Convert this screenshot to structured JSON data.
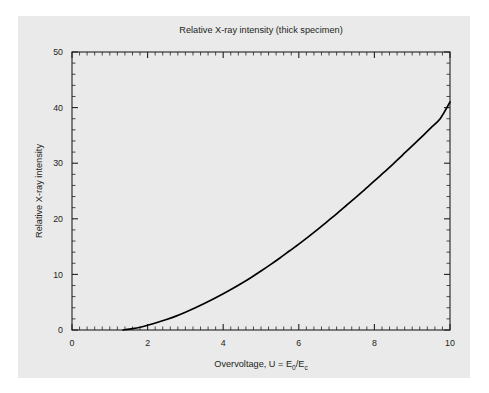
{
  "figure": {
    "background_color": "#ffffff",
    "panel_color": "#eaeaea",
    "curve_color": "#000000",
    "axis_color": "#231f20"
  },
  "chart_data": {
    "type": "line",
    "title": "Relative X-ray intensity (thick specimen)",
    "xlabel_main": "Overvoltage, U = E",
    "xlabel_sub1": "0",
    "xlabel_mid": "/E",
    "xlabel_sub2": "c",
    "xlabel": "Overvoltage, U = E0/Ec",
    "ylabel": "Relative X-ray intensity",
    "xlim": [
      0,
      10
    ],
    "ylim": [
      0,
      50
    ],
    "xticks": [
      0,
      2,
      4,
      6,
      8,
      10
    ],
    "xtick_labels": [
      "0",
      "2",
      "4",
      "6",
      "8",
      "10"
    ],
    "yticks": [
      0,
      10,
      20,
      30,
      40,
      50
    ],
    "ytick_labels": [
      "0",
      "10",
      "20",
      "30",
      "40",
      "50"
    ],
    "x_minor_step": 0.2,
    "y_minor_step": 2,
    "grid": false,
    "legend": null,
    "series": [
      {
        "name": "Relative X-ray intensity",
        "x": [
          1.35,
          1.6,
          1.8,
          2.0,
          2.25,
          2.5,
          2.75,
          3.0,
          3.25,
          3.5,
          3.75,
          4.0,
          4.25,
          4.5,
          4.75,
          5.0,
          5.25,
          5.5,
          5.75,
          6.0,
          6.25,
          6.5,
          6.75,
          7.0,
          7.25,
          7.5,
          7.75,
          8.0,
          8.25,
          8.5,
          8.75,
          9.0,
          9.25,
          9.5,
          9.75,
          10.0
        ],
        "values": [
          0.0,
          0.25,
          0.5,
          0.85,
          1.35,
          1.9,
          2.5,
          3.2,
          3.95,
          4.75,
          5.6,
          6.5,
          7.45,
          8.45,
          9.5,
          10.6,
          11.75,
          12.95,
          14.2,
          15.45,
          16.75,
          18.1,
          19.5,
          20.9,
          22.35,
          23.8,
          25.3,
          26.8,
          28.35,
          29.9,
          31.5,
          33.1,
          34.75,
          36.4,
          38.1,
          41.0
        ]
      }
    ]
  },
  "axes_geometry": {
    "plot_left": 72,
    "plot_right": 450,
    "plot_top": 52,
    "plot_bottom": 330
  }
}
